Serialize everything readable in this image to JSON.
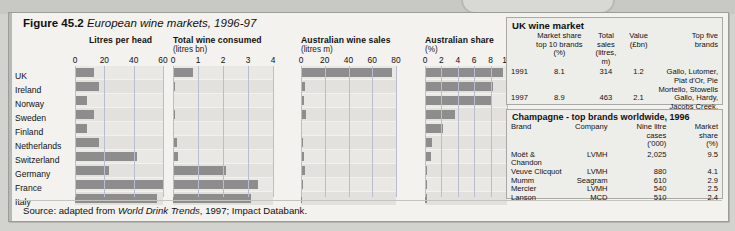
{
  "figure": {
    "number": "Figure 45.2",
    "title": "European wine markets, 1996-97",
    "source": "Source: adapted from World Drink Trends, 1997; Impact Databank.",
    "source_prefix": "Source: adapted from ",
    "source_italic": "World Drink Trends",
    "source_suffix": ", 1997; Impact Databank."
  },
  "categories": [
    "UK",
    "Ireland",
    "Norway",
    "Sweden",
    "Finland",
    "Netherlands",
    "Switzerland",
    "Germany",
    "France",
    "Italy"
  ],
  "chart_data": [
    {
      "type": "bar",
      "orientation": "horizontal",
      "title": "Litres per head",
      "subtitle": "",
      "categories": [
        "UK",
        "Ireland",
        "Norway",
        "Sweden",
        "Finland",
        "Netherlands",
        "Switzerland",
        "Germany",
        "France",
        "Italy"
      ],
      "values": [
        13,
        16.5,
        8,
        13,
        8,
        16.5,
        42,
        23,
        60,
        56
      ],
      "ticks": [
        0,
        20,
        40,
        60
      ],
      "xlim": [
        0,
        60
      ],
      "xlabel": "",
      "ylabel": "",
      "grid": true
    },
    {
      "type": "bar",
      "orientation": "horizontal",
      "title": "Total wine consumed",
      "subtitle": "(litres bn)",
      "categories": [
        "UK",
        "Ireland",
        "Norway",
        "Sweden",
        "Finland",
        "Netherlands",
        "Switzerland",
        "Germany",
        "France",
        "Italy"
      ],
      "values": [
        0.78,
        0.06,
        0.03,
        0.07,
        0.04,
        0.16,
        0.18,
        2.1,
        3.4,
        3.1
      ],
      "ticks": [
        0,
        1,
        2,
        3,
        4
      ],
      "xlim": [
        0,
        4
      ],
      "xlabel": "",
      "ylabel": "",
      "grid": true
    },
    {
      "type": "bar",
      "orientation": "horizontal",
      "title": "Australian wine sales",
      "subtitle": "(litres m)",
      "categories": [
        "UK",
        "Ireland",
        "Norway",
        "Sweden",
        "Finland",
        "Netherlands",
        "Switzerland",
        "Germany",
        "France",
        "Italy"
      ],
      "values": [
        77,
        3.5,
        2.2,
        4.0,
        1.2,
        2.0,
        2.2,
        3.2,
        1.6,
        1.2
      ],
      "ticks": [
        0,
        20,
        40,
        60,
        80
      ],
      "xlim": [
        0,
        80
      ],
      "xlabel": "",
      "ylabel": "",
      "grid": true
    },
    {
      "type": "bar",
      "orientation": "horizontal",
      "title": "Australian share",
      "subtitle": "(%)",
      "categories": [
        "UK",
        "Ireland",
        "Norway",
        "Sweden",
        "Finland",
        "Netherlands",
        "Switzerland",
        "Germany",
        "France",
        "Italy"
      ],
      "values": [
        9.5,
        8.3,
        8.0,
        3.7,
        2.2,
        0.8,
        0.7,
        0.25,
        0.2,
        0.2
      ],
      "ticks": [
        0,
        2,
        4,
        6,
        8,
        10
      ],
      "xlim": [
        0,
        10
      ],
      "xlabel": "",
      "ylabel": "",
      "grid": true
    }
  ],
  "uk_table": {
    "title": "UK wine market",
    "headers": [
      "",
      "Market share\ntop 10 brands (%)",
      "Total sales\n(litres, m)",
      "Value\n(£bn)",
      "Top five\nbrands"
    ],
    "header_lines": [
      [
        "",
        "Market share",
        "Total sales",
        "Value",
        "Top five"
      ],
      [
        "",
        "top 10 brands (%)",
        "(litres, m)",
        "(£bn)",
        "brands"
      ]
    ],
    "rows": [
      {
        "year": "1991",
        "market_share": "8.1",
        "total_sales": "314",
        "value": "1.2",
        "brands": "Gallo, Lutomer, Piat d'Or, Pie Mortello, Stowells"
      },
      {
        "year": "1997",
        "market_share": "8.9",
        "total_sales": "463",
        "value": "2.1",
        "brands": "Gallo, Hardy, Jacobs Creek, Piat d'Or, Stowells"
      }
    ]
  },
  "champagne_table": {
    "title": "Champagne - top brands worldwide, 1996",
    "header_lines": [
      [
        "Brand",
        "Company",
        "Nine litre cases",
        "Market share"
      ],
      [
        "",
        "",
        "('000)",
        "(%)"
      ]
    ],
    "rows": [
      {
        "brand": "Moët & Chandon",
        "company": "LVMH",
        "cases": "2,025",
        "share": "9.5"
      },
      {
        "brand": "Veuve Clicquot",
        "company": "LVMH",
        "cases": "880",
        "share": "4.1"
      },
      {
        "brand": "Mumm",
        "company": "Seagram",
        "cases": "610",
        "share": "2.9"
      },
      {
        "brand": "Mercier",
        "company": "LVMH",
        "cases": "540",
        "share": "2.5"
      },
      {
        "brand": "Lanson",
        "company": "MCD",
        "cases": "510",
        "share": "2.4"
      }
    ]
  },
  "colors": {
    "bar": "#8d8d8d",
    "grid": "#b9bdd0",
    "row": "#e9e8e4",
    "paper": "#f3f2ee"
  }
}
